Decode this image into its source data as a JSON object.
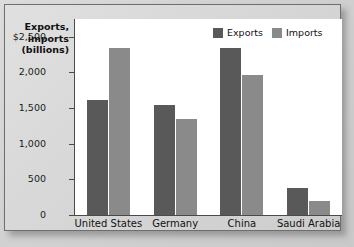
{
  "chart_data": {
    "type": "bar",
    "title": "",
    "xlabel": "",
    "ylabel": "Exports, imports (billions)",
    "ylabel_lines": [
      "Exports,",
      "imports",
      "(billions)"
    ],
    "categories": [
      "United States",
      "Germany",
      "China",
      "Saudi Arabia"
    ],
    "series": [
      {
        "name": "Exports",
        "color": "#595959",
        "values": [
          1610,
          1550,
          2350,
          375
        ]
      },
      {
        "name": "Imports",
        "color": "#8a8a8a",
        "values": [
          2340,
          1340,
          1970,
          190
        ]
      }
    ],
    "ylim": [
      0,
      2750
    ],
    "yticks": [
      0,
      500,
      1000,
      1500,
      2000,
      2500
    ],
    "ytick_labels": [
      "0",
      "500",
      "1,000",
      "1,500",
      "2,000",
      "$2,500"
    ],
    "grid": false,
    "legend_position": "top-right",
    "legend_entries": [
      "Exports",
      "Imports"
    ]
  },
  "colors": {
    "exports": "#595959",
    "imports": "#8a8a8a",
    "plot_background": "#ffffff",
    "figure_background": "#d6d6d6",
    "axis": "#4a4a4a"
  }
}
